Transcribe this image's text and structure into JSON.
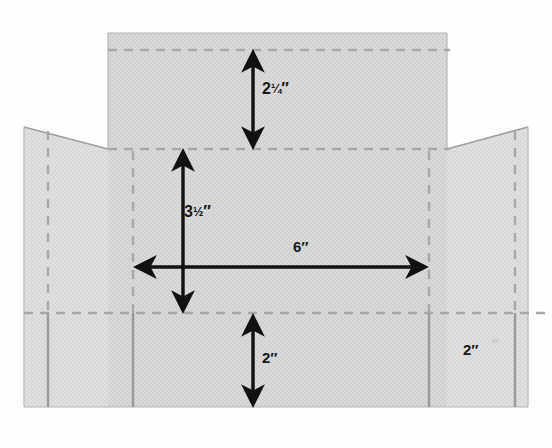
{
  "diagram": {
    "type": "box-template-flat-pattern",
    "colors": {
      "panel_fill": "#d9d9d9",
      "panel_fill_light": "#dedede",
      "fold_line": "#a8a8a8",
      "cut_line": "#9a9a9a",
      "arrow": "#111111",
      "label_text": "#191919",
      "background": "#fdfdfd"
    },
    "dimensions": [
      {
        "id": "top-flap-height",
        "label": "2¼″",
        "value": 2.25,
        "unit": "inch",
        "orientation": "vertical",
        "measures": "top flap height"
      },
      {
        "id": "body-height",
        "label": "3½″",
        "value": 3.5,
        "unit": "inch",
        "orientation": "vertical",
        "measures": "main body height"
      },
      {
        "id": "body-width",
        "label": "6″",
        "value": 6,
        "unit": "inch",
        "orientation": "horizontal",
        "measures": "main body width"
      },
      {
        "id": "bottom-flap-height",
        "label": "2″",
        "value": 2,
        "unit": "inch",
        "orientation": "vertical",
        "measures": "bottom flap height"
      },
      {
        "id": "side-flap-width",
        "label": "2″",
        "value": 2,
        "unit": "inch",
        "orientation": "horizontal",
        "measures": "side flap width"
      }
    ],
    "labels": {
      "top_flap": {
        "whole": "2",
        "fraction": "¼",
        "unit": "″"
      },
      "body_height": {
        "whole": "3",
        "fraction": "½",
        "unit": "″"
      },
      "body_width": {
        "whole": "6",
        "fraction": "",
        "unit": "″"
      },
      "bottom_flap": {
        "whole": "2",
        "fraction": "",
        "unit": "″"
      },
      "right_side_flap": {
        "whole": "2",
        "fraction": "",
        "unit": "″"
      }
    },
    "panels": [
      {
        "id": "top-flap",
        "name": "Top flap panel"
      },
      {
        "id": "left-wing",
        "name": "Left side flap panel"
      },
      {
        "id": "right-wing",
        "name": "Right side flap panel"
      },
      {
        "id": "main-body",
        "name": "Main body panel"
      }
    ],
    "fold_lines": {
      "horizontal": [
        {
          "id": "fold-top",
          "y": 50
        },
        {
          "id": "fold-middle",
          "y": 149
        },
        {
          "id": "fold-bottom",
          "y": 313
        }
      ],
      "vertical_dashed": [
        {
          "id": "fold-left-outer",
          "x": 48
        },
        {
          "id": "fold-left-inner",
          "x": 133
        },
        {
          "id": "fold-right-inner",
          "x": 429
        },
        {
          "id": "fold-right-outer",
          "x": 515
        }
      ],
      "vertical_solid": [
        {
          "id": "cut-left-outer",
          "x": 48
        },
        {
          "id": "cut-left-inner",
          "x": 133
        },
        {
          "id": "cut-right-inner",
          "x": 429
        },
        {
          "id": "cut-right-outer",
          "x": 515
        }
      ]
    }
  }
}
